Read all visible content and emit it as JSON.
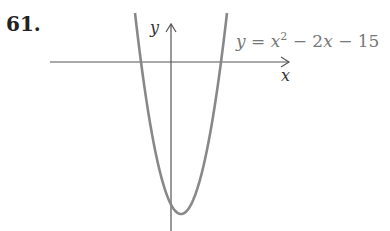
{
  "problem": {
    "number": "61."
  },
  "chart_data": {
    "type": "line",
    "title": "",
    "function": "y = x^2 - 2x - 15",
    "equation_label": {
      "lhs": "y",
      "rhs_parts": [
        "x",
        "2",
        " − 2",
        "x",
        " − 15"
      ]
    },
    "xlabel": "x",
    "ylabel": "y",
    "grid": false,
    "ticks": false,
    "x_intercepts": [
      -3,
      5
    ],
    "vertex": [
      1,
      -16
    ],
    "y_intercept": -15,
    "xlim": [
      -12,
      12
    ],
    "ylim": [
      -17.5,
      5
    ],
    "x": [
      -3.6,
      -3,
      -2,
      -1,
      0,
      1,
      2,
      3,
      4,
      5,
      5.6
    ],
    "y": [
      4.56,
      0,
      -7,
      -12,
      -15,
      -16,
      -15,
      -12,
      -7,
      0,
      4.56
    ],
    "colors": {
      "curve": "#888888",
      "axes": "#555555"
    }
  }
}
